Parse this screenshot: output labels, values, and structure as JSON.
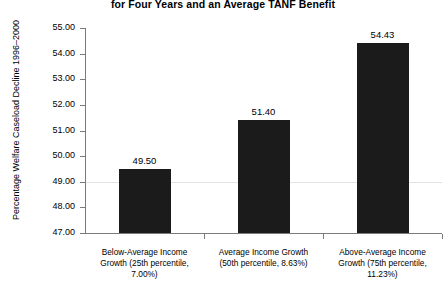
{
  "chart_data": {
    "type": "bar",
    "title": "for Four Years and an Average TANF Benefit",
    "xlabel": "",
    "ylabel": "Percentage Welfare Caseload Decline 1996–2000",
    "ylim": [
      47.0,
      55.0
    ],
    "ytick_step": 1.0,
    "grid": true,
    "gridlines_at": [
      49.0
    ],
    "legend": null,
    "legend_position": "none",
    "bar_color": "#1b1b1b",
    "categories": [
      "Below-Average Income Growth (25th percentile, 7.00%)",
      "Average Income Growth (50th percentile, 8.63%)",
      "Above-Average Income Growth (75th percentile, 11.23%)"
    ],
    "category_lines": [
      [
        "Below-Average Income",
        "Growth (25th percentile,",
        "7.00%)"
      ],
      [
        "Average Income Growth",
        "(50th percentile, 8.63%)"
      ],
      [
        "Above-Average Income",
        "Growth (75th percentile,",
        "11.23%)"
      ]
    ],
    "values": [
      49.5,
      51.4,
      54.43
    ],
    "value_labels": [
      "49.50",
      "51.40",
      "54.43"
    ],
    "ytick_labels": [
      "55.00",
      "54.00",
      "53.00",
      "52.00",
      "51.00",
      "50.00",
      "49.00",
      "48.00",
      "47.00"
    ],
    "ytick_values": [
      55.0,
      54.0,
      53.0,
      52.0,
      51.0,
      50.0,
      49.0,
      48.0,
      47.0
    ]
  }
}
